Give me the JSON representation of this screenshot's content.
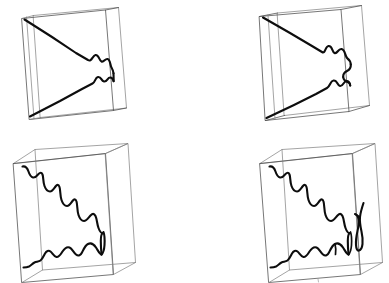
{
  "figure": {
    "background_color": "#ffffff",
    "edge_color": "#4a4a4a",
    "faint_edge_color": "#7d7d7d",
    "crack_color": "#0d0d0d",
    "panel_count": 4,
    "grid": "2x2"
  },
  "panels": [
    {
      "id": "a",
      "position": "top-left",
      "name": "thin-slab-wedge-front",
      "description": "Thin 3D slab wireframe box viewed at an angle, containing a thick black wedge-shaped crack front that opens from the right edge toward the upper-left and lower-left corners",
      "slab_thickness": "thin",
      "crack_style": "wedge",
      "crack_branches": 2,
      "crack_anchor_edge": "right",
      "box": {
        "front_face": [
          [
            22,
            18
          ],
          [
            105,
            9
          ],
          [
            113,
            110
          ],
          [
            29,
            119
          ]
        ],
        "back_face": [
          [
            33,
            16
          ],
          [
            118,
            7
          ],
          [
            126,
            108
          ],
          [
            40,
            118
          ]
        ],
        "depth_direction": "right-up"
      }
    },
    {
      "id": "b",
      "position": "top-right",
      "name": "thick-slab-wedge-front",
      "description": "Thicker 3D slab wireframe box with a more developed wedge crack front showing pronounced lobed undulations near the right anchor edge",
      "slab_thickness": "medium",
      "crack_style": "wedge-lobed",
      "crack_branches": 2,
      "crack_anchor_edge": "right",
      "box": {
        "front_face": [
          [
            66,
            16
          ],
          [
            147,
            10
          ],
          [
            155,
            112
          ],
          [
            71,
            120
          ]
        ],
        "back_face": [
          [
            84,
            13
          ],
          [
            168,
            6
          ],
          [
            176,
            106
          ],
          [
            90,
            116
          ]
        ],
        "depth_direction": "right-up"
      }
    },
    {
      "id": "c",
      "position": "bottom-left",
      "name": "deep-box-zigzag-cracks",
      "description": "Deep open 3D wireframe box containing a large zig-zag sawtooth crack descending from upper-left to lower-right plus a lower arcade of rounded crack lobes along the bottom",
      "slab_thickness": "deep",
      "crack_style": "sawtooth-and-arcade",
      "crack_branches": 2,
      "crack_anchor_edge": "right-interior",
      "box": {
        "front_face": [
          [
            13,
            22
          ],
          [
            105,
            12
          ],
          [
            113,
            134
          ],
          [
            22,
            142
          ]
        ],
        "back_face": [
          [
            35,
            8
          ],
          [
            128,
            2
          ],
          [
            135,
            122
          ],
          [
            43,
            130
          ]
        ],
        "depth_direction": "right-up"
      }
    },
    {
      "id": "d",
      "position": "bottom-right",
      "name": "deep-box-zigzag-cracks-with-loop",
      "description": "Deep open 3D wireframe box with the same sawtooth and arcade crack system plus an additional detached narrow vertical crack loop near the right wall",
      "slab_thickness": "deep",
      "crack_style": "sawtooth-arcade-and-loop",
      "crack_branches": 3,
      "crack_anchor_edge": "right-interior",
      "box": {
        "front_face": [
          [
            66,
            22
          ],
          [
            158,
            12
          ],
          [
            166,
            134
          ],
          [
            75,
            142
          ]
        ],
        "back_face": [
          [
            88,
            8
          ],
          [
            181,
            2
          ],
          [
            188,
            122
          ],
          [
            96,
            130
          ]
        ],
        "depth_direction": "right-up"
      }
    }
  ],
  "annotations": {
    "panel_labels_visible": false,
    "axis_labels_visible": false,
    "legend_visible": false,
    "caption_visible": false
  }
}
